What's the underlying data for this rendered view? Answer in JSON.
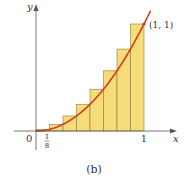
{
  "chart_data": {
    "type": "bar",
    "title": "",
    "subtitle": "",
    "caption": "(b)",
    "xlabel": "x",
    "ylabel": "y",
    "function": "y = x^2",
    "curve_color": "#d93a1e",
    "rect_fill": "#f7dc7a",
    "rect_stroke": "#8a7a3a",
    "categories": [
      "1/8",
      "2/8",
      "3/8",
      "4/8",
      "5/8",
      "6/8",
      "7/8",
      "1"
    ],
    "x": [
      0.125,
      0.25,
      0.375,
      0.5,
      0.625,
      0.75,
      0.875,
      1.0
    ],
    "values": [
      0.015625,
      0.0625,
      0.140625,
      0.25,
      0.390625,
      0.5625,
      0.765625,
      1.0
    ],
    "rect_width": 0.125,
    "x_ticks": [
      "0",
      "1/8",
      "1"
    ],
    "annotations": [
      {
        "text": "(1, 1)",
        "x": 1,
        "y": 1
      }
    ],
    "xlim": [
      0,
      1.2
    ],
    "ylim": [
      0,
      1.2
    ],
    "grid": false,
    "legend": "none"
  },
  "labels": {
    "y_axis": "y",
    "x_axis": "x",
    "origin": "0",
    "tick_eighth_num": "1",
    "tick_eighth_den": "8",
    "tick_one": "1",
    "point": "(1, 1)",
    "caption": "(b)"
  }
}
